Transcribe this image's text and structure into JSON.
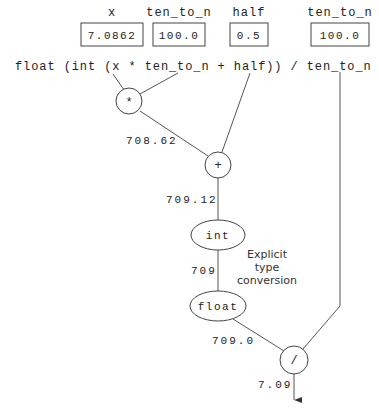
{
  "variables": [
    {
      "name": "x",
      "value": "7.0862"
    },
    {
      "name": "ten_to_n",
      "value": "100.0"
    },
    {
      "name": "half",
      "value": "0.5"
    },
    {
      "name": "ten_to_n",
      "value": "100.0"
    }
  ],
  "expression": "float (int (x * ten_to_n + half)) / ten_to_n",
  "nodes": {
    "multiply": "*",
    "add": "+",
    "int": "int",
    "float": "float",
    "divide": "/"
  },
  "intermediate_values": {
    "after_multiply": "708.62",
    "after_add": "709.12",
    "after_int": "709",
    "after_float": "709.0",
    "result": "7.09"
  },
  "annotation": {
    "line1": "Explicit",
    "line2": "type",
    "line3": "conversion"
  }
}
